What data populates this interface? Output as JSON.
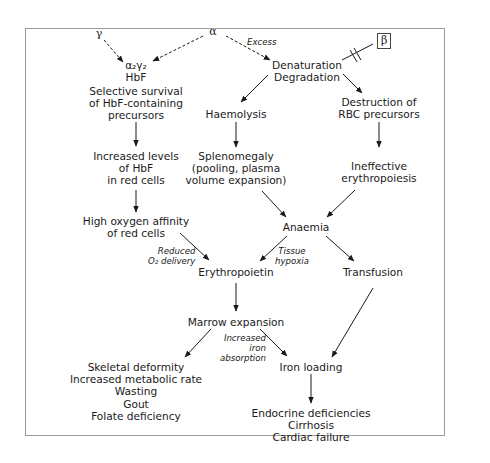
{
  "diagram": {
    "type": "flowchart",
    "title": "",
    "genes": {
      "gamma": "γ",
      "alpha": "α",
      "beta": "β"
    },
    "nodes": [
      {
        "id": "hbf_formula",
        "lines": [
          "α₂γ₂",
          "HbF"
        ]
      },
      {
        "id": "selective",
        "lines": [
          "Selective survival",
          "of HbF-containing",
          "precursors"
        ]
      },
      {
        "id": "increased_hbf",
        "lines": [
          "Increased levels",
          "of HbF",
          "in red cells"
        ]
      },
      {
        "id": "high_affinity",
        "lines": [
          "High oxygen affinity",
          "of red cells"
        ]
      },
      {
        "id": "denaturation",
        "lines": [
          "Denaturation",
          "Degradation"
        ]
      },
      {
        "id": "haemolysis",
        "lines": [
          "Haemolysis"
        ]
      },
      {
        "id": "splenomegaly",
        "lines": [
          "Splenomegaly",
          "(pooling, plasma",
          "volume expansion)"
        ]
      },
      {
        "id": "destruction",
        "lines": [
          "Destruction of",
          "RBC precursors"
        ]
      },
      {
        "id": "ineffective",
        "lines": [
          "Ineffective",
          "erythropoiesis"
        ]
      },
      {
        "id": "anaemia",
        "lines": [
          "Anaemia"
        ]
      },
      {
        "id": "erythropoietin",
        "lines": [
          "Erythropoietin"
        ]
      },
      {
        "id": "transfusion",
        "lines": [
          "Transfusion"
        ]
      },
      {
        "id": "marrow",
        "lines": [
          "Marrow expansion"
        ]
      },
      {
        "id": "skeletal",
        "lines": [
          "Skeletal deformity",
          "Increased metabolic rate",
          "Wasting",
          "Gout",
          "Folate deficiency"
        ]
      },
      {
        "id": "iron_loading",
        "lines": [
          "Iron loading"
        ]
      },
      {
        "id": "endocrine",
        "lines": [
          "Endocrine deficiencies",
          "Cirrhosis",
          "Cardiac failure"
        ]
      }
    ],
    "edge_labels": {
      "excess": [
        "Excess"
      ],
      "reduced_o2": [
        "Reduced",
        "O₂ delivery"
      ],
      "tissue_hypoxia": [
        "Tissue",
        "hypoxia"
      ],
      "increased_iron": [
        "Increased",
        "iron",
        "absorption"
      ]
    },
    "edges": [
      {
        "from": "gamma",
        "to": "hbf_formula",
        "style": "dashed"
      },
      {
        "from": "alpha",
        "to": "hbf_formula",
        "style": "dashed"
      },
      {
        "from": "alpha",
        "to": "denaturation",
        "style": "dashed",
        "label": "Excess"
      },
      {
        "from": "beta",
        "to": "denaturation",
        "style": "blocked"
      },
      {
        "from": "selective",
        "to": "increased_hbf"
      },
      {
        "from": "increased_hbf",
        "to": "high_affinity"
      },
      {
        "from": "high_affinity",
        "to": "erythropoietin",
        "label": "Reduced O₂ delivery"
      },
      {
        "from": "denaturation",
        "to": "haemolysis"
      },
      {
        "from": "denaturation",
        "to": "destruction"
      },
      {
        "from": "haemolysis",
        "to": "splenomegaly"
      },
      {
        "from": "destruction",
        "to": "ineffective"
      },
      {
        "from": "splenomegaly",
        "to": "anaemia"
      },
      {
        "from": "ineffective",
        "to": "anaemia"
      },
      {
        "from": "anaemia",
        "to": "erythropoietin",
        "label": "Tissue hypoxia"
      },
      {
        "from": "anaemia",
        "to": "transfusion"
      },
      {
        "from": "erythropoietin",
        "to": "marrow"
      },
      {
        "from": "marrow",
        "to": "skeletal"
      },
      {
        "from": "marrow",
        "to": "iron_loading",
        "label": "Increased iron absorption"
      },
      {
        "from": "transfusion",
        "to": "iron_loading"
      },
      {
        "from": "iron_loading",
        "to": "endocrine"
      }
    ]
  }
}
